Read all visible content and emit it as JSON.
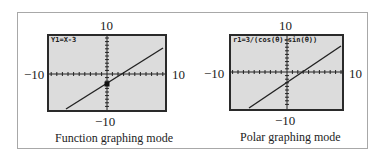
{
  "panels": [
    {
      "id": "function",
      "equation": "Y1=X-3",
      "window": {
        "xmin": "−10",
        "xmax": "10",
        "ymin": "−10",
        "ymax": "10"
      },
      "caption": "Function graphing mode",
      "line": {
        "slope": 1,
        "intercept": -3
      },
      "cursor": {
        "x": 0,
        "y": -3
      }
    },
    {
      "id": "polar",
      "equation": "r1=3/(cos(θ)-sin(θ))",
      "window": {
        "xmin": "−10",
        "xmax": "10",
        "ymin": "−10",
        "ymax": "10"
      },
      "caption": "Polar graphing mode",
      "line": {
        "slope": 1,
        "intercept": -3
      }
    }
  ],
  "colors": {
    "screen_bg": "#dcdcdc",
    "screen_border": "#2a2a2a",
    "plot": "#222222",
    "frame_border": "#a8a8a8"
  }
}
